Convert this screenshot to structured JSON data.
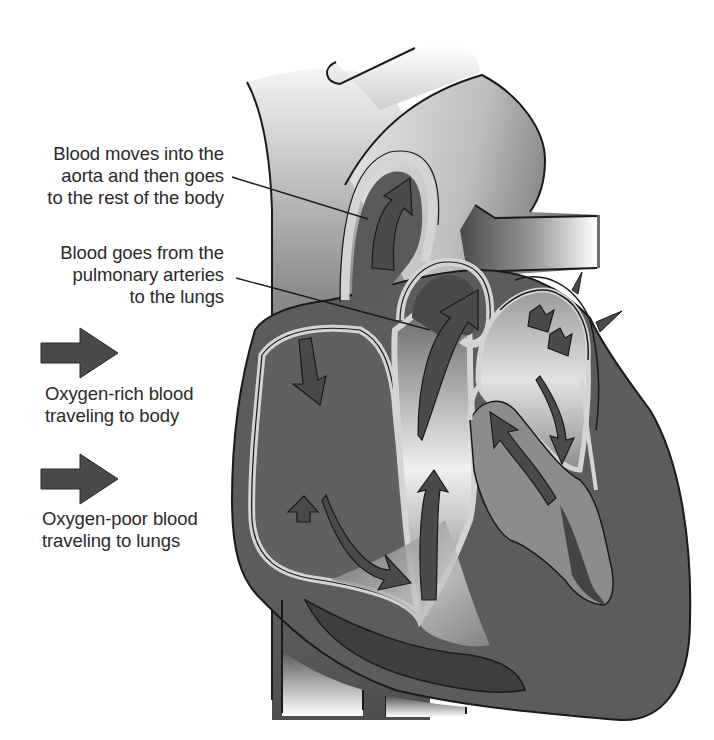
{
  "diagram": {
    "colors": {
      "background": "#ffffff",
      "outline": "#1a1a1a",
      "heart_dark": "#5a5a5a",
      "heart_darker": "#3e3e3e",
      "arrow": "#4a4a4a",
      "vessel_wall": "#d2d2d2",
      "highlight": "#f2f2f2",
      "text": "#2a2a2a"
    },
    "callouts": [
      {
        "id": "aorta",
        "lines": [
          "Blood moves into the",
          "aorta and then goes",
          "to the rest of the body"
        ]
      },
      {
        "id": "pulmonary",
        "lines": [
          "Blood goes from the",
          "pulmonary arteries",
          "to the lungs"
        ]
      }
    ],
    "legend": [
      {
        "id": "oxygen-rich",
        "arrow_color": "#4a4a4a",
        "lines": [
          "Oxygen-rich blood",
          "traveling to body"
        ]
      },
      {
        "id": "oxygen-poor",
        "arrow_color": "#4a4a4a",
        "lines": [
          "Oxygen-poor blood",
          "traveling to lungs"
        ]
      }
    ]
  }
}
